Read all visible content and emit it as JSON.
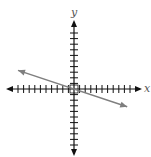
{
  "chart_data": {
    "type": "line",
    "title": "",
    "xlabel": "x",
    "ylabel": "y",
    "xlim": [
      -11.5,
      11.5
    ],
    "ylim": [
      -11.5,
      11.5
    ],
    "x_ticks_per_side": 10,
    "y_ticks_per_side": 10,
    "grid": false,
    "series": [
      {
        "name": "line",
        "equation": "y = -x/3",
        "slope": -0.3333,
        "intercept": 0,
        "x": [
          -10,
          9.5
        ],
        "y": [
          3.33,
          -3.17
        ],
        "arrows": "both",
        "color": "#7f7f7f"
      }
    ],
    "axis_color": "#111111"
  }
}
